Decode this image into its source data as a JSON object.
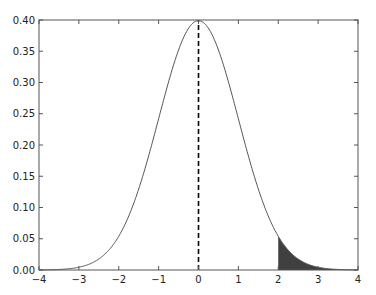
{
  "chart_data": {
    "type": "line",
    "title": "",
    "xlabel": "",
    "ylabel": "",
    "xlim": [
      -4,
      4
    ],
    "ylim": [
      0,
      0.4
    ],
    "grid": false,
    "legend": null,
    "x_ticks": [
      -4,
      -3,
      -2,
      -1,
      0,
      1,
      2,
      3,
      4
    ],
    "x_tick_labels": [
      "−4",
      "−3",
      "−2",
      "−1",
      "0",
      "1",
      "2",
      "3",
      "4"
    ],
    "y_ticks": [
      0.0,
      0.05,
      0.1,
      0.15,
      0.2,
      0.25,
      0.3,
      0.35,
      0.4
    ],
    "y_tick_labels": [
      "0.00",
      "0.05",
      "0.10",
      "0.15",
      "0.20",
      "0.25",
      "0.30",
      "0.35",
      "0.40"
    ],
    "series": [
      {
        "name": "standard normal pdf",
        "function": "(1/sqrt(2*pi)) * exp(-x^2/2)",
        "x": [
          -4,
          -3.5,
          -3,
          -2.5,
          -2,
          -1.5,
          -1,
          -0.5,
          0,
          0.5,
          1,
          1.5,
          2,
          2.5,
          3,
          3.5,
          4
        ],
        "y": [
          0.0001,
          0.0009,
          0.0044,
          0.0175,
          0.054,
          0.1295,
          0.242,
          0.3521,
          0.3989,
          0.3521,
          0.242,
          0.1295,
          0.054,
          0.0175,
          0.0044,
          0.0009,
          0.0001
        ],
        "color": "#555555",
        "linewidth": 1
      }
    ],
    "annotations": [
      {
        "type": "vline",
        "x": 0,
        "y_from": 0,
        "y_to": 0.3989,
        "style": "dashed",
        "color": "#000000"
      },
      {
        "type": "fill_between",
        "x_from": 2,
        "x_to": 4,
        "under": "standard normal pdf",
        "color": "#404040"
      }
    ]
  },
  "colors": {
    "frame": "#555555",
    "curve": "#555555",
    "dashed_line": "#000000",
    "shaded_tail": "#404040",
    "background": "#ffffff"
  }
}
